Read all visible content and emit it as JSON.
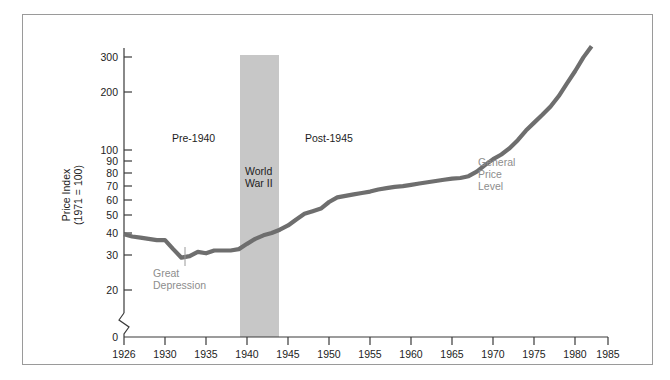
{
  "chart_data": {
    "type": "line",
    "title": "",
    "xlabel": "",
    "ylabel": "Price Index\n(1971 = 100)",
    "ylabel_line1": "Price Index",
    "ylabel_line2": "(1971 = 100)",
    "yscale": "log",
    "ylim": [
      18,
      360
    ],
    "xlim": [
      1926,
      1985
    ],
    "grid": false,
    "legend": "none",
    "y_ticks": [
      300,
      200,
      100,
      90,
      80,
      70,
      60,
      50,
      40,
      30,
      20
    ],
    "y_tick_labels": [
      "300",
      "200",
      "100",
      "90",
      "80",
      "70",
      "60",
      "50",
      "40",
      "30",
      "20"
    ],
    "y_origin_label": "0",
    "axis_break": true,
    "x_ticks": [
      1926,
      1930,
      1935,
      1940,
      1945,
      1950,
      1955,
      1960,
      1965,
      1970,
      1975,
      1980,
      1985
    ],
    "x_tick_labels": [
      "1926",
      "1930",
      "1935",
      "1940",
      "1945",
      "1950",
      "1955",
      "1960",
      "1965",
      "1970",
      "1975",
      "1980",
      "1985"
    ],
    "series": [
      {
        "name": "General Price Level",
        "color": "#6e6e6e",
        "x": [
          1926,
          1927,
          1928,
          1929,
          1930,
          1931,
          1932,
          1933,
          1934,
          1935,
          1936,
          1937,
          1938,
          1939,
          1940,
          1941,
          1942,
          1943,
          1944,
          1945,
          1946,
          1947,
          1948,
          1949,
          1950,
          1951,
          1952,
          1953,
          1954,
          1955,
          1956,
          1957,
          1958,
          1959,
          1960,
          1961,
          1962,
          1963,
          1964,
          1965,
          1966,
          1967,
          1968,
          1969,
          1970,
          1971,
          1972,
          1973,
          1974,
          1975,
          1976,
          1977,
          1978,
          1979,
          1980,
          1981,
          1982,
          1983
        ],
        "y": [
          38,
          37,
          36.5,
          36,
          35.5,
          35.5,
          32,
          29,
          29.5,
          31,
          30.5,
          31.5,
          31.5,
          31.5,
          32,
          34,
          36,
          37.5,
          38.5,
          40,
          42,
          45,
          48,
          49.5,
          51,
          55,
          58,
          59,
          60,
          61,
          62,
          63.5,
          64.5,
          65.5,
          66,
          67,
          68,
          69,
          70,
          71,
          72,
          72.5,
          74,
          78,
          84,
          90,
          95,
          102,
          112,
          125,
          137,
          150,
          165,
          186,
          215,
          248,
          290,
          330
        ]
      }
    ],
    "shaded_regions": [
      {
        "label": "World War II",
        "x_start": 1940,
        "x_end": 1945,
        "color": "#c7c7c7"
      }
    ],
    "annotations": [
      {
        "text": "Pre-1940",
        "x": 1932,
        "y_px": 139,
        "style": "dark"
      },
      {
        "text": "Post-1945",
        "x": 1950,
        "y_px": 139,
        "style": "dark"
      },
      {
        "text": "World War II",
        "line1": "World",
        "line2": "War II",
        "x": 1941,
        "y_px": 172,
        "style": "dark"
      },
      {
        "text": "Great Depression",
        "line1": "Great",
        "line2": "Depression",
        "x": 1933,
        "y_px": 269,
        "style": "gray"
      },
      {
        "text": "General Price Level",
        "line1": "General",
        "line2": "Price",
        "line3": "Level",
        "x": 1972,
        "y_px": 163,
        "style": "gray"
      }
    ]
  }
}
